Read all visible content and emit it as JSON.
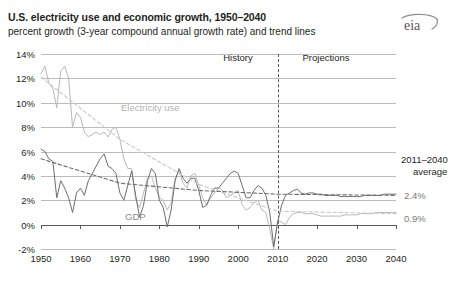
{
  "header": {
    "title": "U.S. electricity use and economic growth, 1950–2040",
    "subtitle": "percent growth (3-year compound annual growth rate) and trend lines",
    "logo_alt": "eia"
  },
  "annotations": {
    "history_label": "History",
    "projections_label": "Projections",
    "electricity_label": "Electricity use",
    "gdp_label": "GDP",
    "average_note_line1": "2011–2040",
    "average_note_line2": "average",
    "gdp_average": "2.4%",
    "electricity_average": "0.9%"
  },
  "colors": {
    "electricity": "#b9b9b9",
    "gdp": "#6d6e70",
    "electricity_trend": "#c9c9c9",
    "gdp_trend": "#6d6e70",
    "grid": "#bcbcbc",
    "axis": "#58595b",
    "text": "#231f20"
  },
  "chart_data": {
    "type": "line",
    "title": "U.S. electricity use and economic growth, 1950–2040",
    "subtitle": "percent growth (3-year compound annual growth rate) and trend lines",
    "xlabel": "",
    "ylabel": "percent growth (3-year compound annual growth rate)",
    "xlim": [
      1950,
      2040
    ],
    "ylim": [
      -2,
      14
    ],
    "grid": true,
    "legend_position": "inline-labels",
    "xticks": [
      1950,
      1960,
      1970,
      1980,
      1990,
      2000,
      2010,
      2020,
      2030,
      2040
    ],
    "yticks": [
      "-2%",
      "0%",
      "2%",
      "4%",
      "6%",
      "8%",
      "10%",
      "12%",
      "14%"
    ],
    "ytick_values": [
      -2,
      0,
      2,
      4,
      6,
      8,
      10,
      12,
      14
    ],
    "divider_year": 2010,
    "divider_labels": [
      "History",
      "Projections"
    ],
    "series": [
      {
        "name": "Electricity use",
        "style": "solid",
        "color": "#b9b9b9",
        "x": [
          1950,
          1951,
          1952,
          1953,
          1954,
          1955,
          1956,
          1957,
          1958,
          1959,
          1960,
          1961,
          1962,
          1963,
          1964,
          1965,
          1966,
          1967,
          1968,
          1969,
          1970,
          1971,
          1972,
          1973,
          1974,
          1975,
          1976,
          1977,
          1978,
          1979,
          1980,
          1981,
          1982,
          1983,
          1984,
          1985,
          1986,
          1987,
          1988,
          1989,
          1990,
          1991,
          1992,
          1993,
          1994,
          1995,
          1996,
          1997,
          1998,
          1999,
          2000,
          2001,
          2002,
          2003,
          2004,
          2005,
          2006,
          2007,
          2008,
          2009,
          2010,
          2011,
          2012,
          2013,
          2014,
          2015,
          2016,
          2017,
          2018,
          2019,
          2020,
          2021,
          2022,
          2023,
          2024,
          2025,
          2026,
          2027,
          2028,
          2029,
          2030,
          2031,
          2032,
          2033,
          2034,
          2035,
          2036,
          2037,
          2038,
          2039,
          2040
        ],
        "values": [
          12.4,
          13.0,
          11.6,
          11.2,
          9.6,
          12.6,
          13.0,
          12.0,
          8.0,
          9.2,
          8.8,
          7.6,
          7.2,
          7.4,
          7.6,
          7.4,
          7.6,
          7.2,
          7.8,
          8.0,
          7.0,
          5.4,
          4.6,
          4.6,
          2.0,
          1.4,
          2.6,
          3.8,
          4.0,
          3.0,
          2.2,
          2.0,
          1.2,
          1.8,
          3.8,
          4.4,
          3.4,
          3.0,
          4.0,
          4.2,
          3.2,
          2.2,
          1.6,
          2.2,
          2.6,
          3.0,
          2.8,
          2.2,
          2.4,
          2.6,
          2.8,
          1.6,
          1.2,
          1.4,
          1.8,
          2.0,
          1.2,
          1.0,
          -0.4,
          -2.0,
          0.4,
          0.2,
          0.0,
          0.6,
          0.9,
          1.0,
          1.0,
          0.9,
          0.9,
          0.9,
          0.8,
          0.7,
          0.7,
          0.7,
          0.7,
          0.7,
          0.7,
          0.8,
          0.8,
          0.8,
          0.8,
          0.9,
          0.9,
          0.9,
          0.9,
          1.0,
          1.0,
          1.0,
          1.0,
          1.0,
          1.0
        ]
      },
      {
        "name": "GDP",
        "style": "solid",
        "color": "#6d6e70",
        "x": [
          1950,
          1951,
          1952,
          1953,
          1954,
          1955,
          1956,
          1957,
          1958,
          1959,
          1960,
          1961,
          1962,
          1963,
          1964,
          1965,
          1966,
          1967,
          1968,
          1969,
          1970,
          1971,
          1972,
          1973,
          1974,
          1975,
          1976,
          1977,
          1978,
          1979,
          1980,
          1981,
          1982,
          1983,
          1984,
          1985,
          1986,
          1987,
          1988,
          1989,
          1990,
          1991,
          1992,
          1993,
          1994,
          1995,
          1996,
          1997,
          1998,
          1999,
          2000,
          2001,
          2002,
          2003,
          2004,
          2005,
          2006,
          2007,
          2008,
          2009,
          2010,
          2011,
          2012,
          2013,
          2014,
          2015,
          2016,
          2017,
          2018,
          2019,
          2020,
          2021,
          2022,
          2023,
          2024,
          2025,
          2026,
          2027,
          2028,
          2029,
          2030,
          2031,
          2032,
          2033,
          2034,
          2035,
          2036,
          2037,
          2038,
          2039,
          2040
        ],
        "values": [
          6.2,
          6.0,
          5.4,
          5.2,
          2.2,
          3.6,
          3.0,
          2.2,
          1.0,
          2.6,
          3.0,
          2.4,
          3.6,
          4.2,
          4.8,
          5.4,
          5.8,
          4.8,
          4.6,
          4.2,
          2.6,
          2.0,
          3.2,
          4.4,
          2.4,
          0.6,
          1.6,
          3.6,
          4.6,
          4.2,
          2.0,
          1.4,
          -0.2,
          1.2,
          3.6,
          4.6,
          3.8,
          3.4,
          3.8,
          3.8,
          2.8,
          1.4,
          1.6,
          2.4,
          3.0,
          3.0,
          3.4,
          3.8,
          4.2,
          4.4,
          4.2,
          3.2,
          2.2,
          2.2,
          2.8,
          3.2,
          3.0,
          2.4,
          1.0,
          -1.8,
          0.2,
          1.6,
          2.4,
          2.6,
          2.8,
          2.9,
          2.6,
          2.5,
          2.6,
          2.6,
          2.5,
          2.5,
          2.4,
          2.4,
          2.4,
          2.4,
          2.3,
          2.3,
          2.3,
          2.3,
          2.3,
          2.3,
          2.4,
          2.4,
          2.4,
          2.4,
          2.4,
          2.5,
          2.5,
          2.5,
          2.5
        ]
      },
      {
        "name": "Electricity use trend",
        "style": "dashed",
        "color": "#c9c9c9",
        "x": [
          1950,
          1970,
          1990,
          2010,
          2040
        ],
        "values": [
          12.1,
          7.0,
          3.3,
          1.1,
          0.9
        ]
      },
      {
        "name": "GDP trend",
        "style": "dashed",
        "color": "#6d6e70",
        "x": [
          1950,
          1970,
          1990,
          2010,
          2040
        ],
        "values": [
          5.4,
          3.4,
          2.8,
          2.5,
          2.4
        ]
      }
    ],
    "annotations": [
      {
        "text": "History",
        "x": 1988,
        "y": 13.2
      },
      {
        "text": "Projections",
        "x": 2026,
        "y": 13.2
      },
      {
        "text": "Electricity use",
        "x": 1972,
        "y": 9.4
      },
      {
        "text": "GDP",
        "x": 1972,
        "y": 1.1
      },
      {
        "text": "2011–2040 average",
        "x": 2044,
        "y": 5.0
      },
      {
        "text": "2.4%",
        "x": 2044,
        "y": 2.4
      },
      {
        "text": "0.9%",
        "x": 2044,
        "y": 0.9
      }
    ]
  }
}
